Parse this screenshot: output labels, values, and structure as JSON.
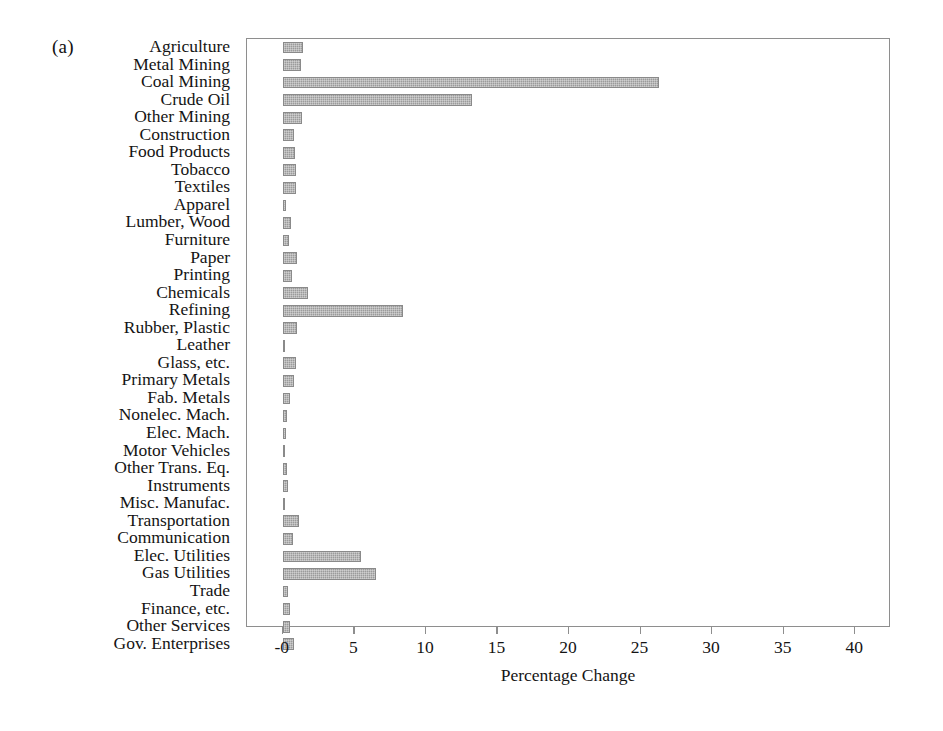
{
  "panel": {
    "label": "(a)"
  },
  "chart_data": {
    "type": "bar",
    "orientation": "horizontal",
    "title": "",
    "xlabel": "Percentage Change",
    "ylabel": "",
    "xlim": [
      -2.5,
      42.5
    ],
    "xticks": [
      0,
      5,
      10,
      15,
      20,
      25,
      30,
      35,
      40
    ],
    "xtick_labels": [
      "-0",
      "5",
      "10",
      "15",
      "20",
      "25",
      "30",
      "35",
      "40"
    ],
    "grid": false,
    "legend": null,
    "bar_color": "#9b9b9b",
    "categories": [
      "Agriculture",
      "Metal Mining",
      "Coal Mining",
      "Crude Oil",
      "Other Mining",
      "Construction",
      "Food Products",
      "Tobacco",
      "Textiles",
      "Apparel",
      "Lumber, Wood",
      "Furniture",
      "Paper",
      "Printing",
      "Chemicals",
      "Refining",
      "Rubber, Plastic",
      "Leather",
      "Glass, etc.",
      "Primary Metals",
      "Fab. Metals",
      "Nonelec. Mach.",
      "Elec. Mach.",
      "Motor Vehicles",
      "Other Trans. Eq.",
      "Instruments",
      "Misc. Manufac.",
      "Transportation",
      "Communication",
      "Elec. Utilities",
      "Gas Utilities",
      "Trade",
      "Finance, etc.",
      "Other Services",
      "Gov. Enterprises"
    ],
    "values": [
      1.4,
      1.3,
      26.3,
      13.2,
      1.35,
      0.8,
      0.85,
      0.95,
      0.95,
      0.2,
      0.6,
      0.45,
      1.0,
      0.65,
      1.75,
      8.4,
      1.0,
      0.1,
      0.95,
      0.8,
      0.5,
      0.3,
      0.25,
      0.15,
      0.3,
      0.35,
      0.1,
      1.1,
      0.7,
      5.5,
      6.5,
      0.35,
      0.5,
      0.5,
      0.8
    ]
  }
}
